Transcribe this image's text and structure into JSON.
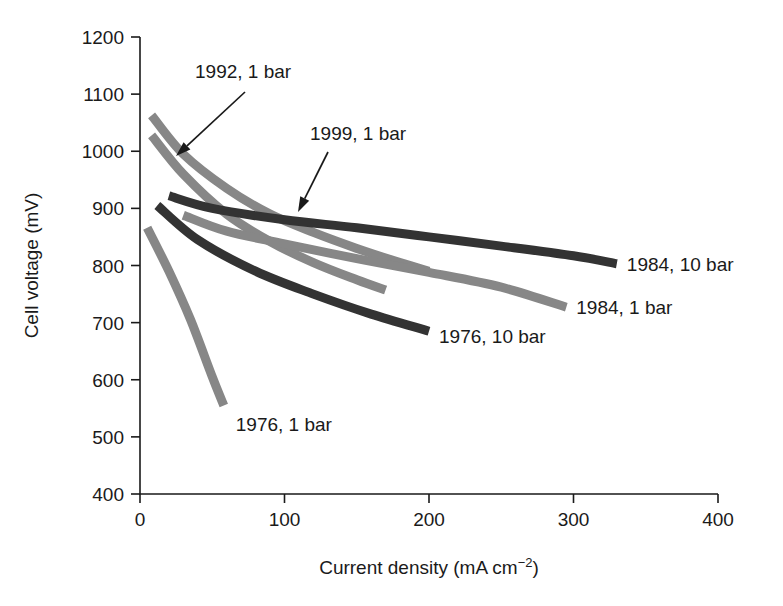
{
  "chart_data": {
    "type": "line",
    "title": "",
    "xlabel": "Current density (mA cm−2)",
    "xlabel_main": "Current density (mA cm",
    "xlabel_sup": "−2",
    "xlabel_tail": ")",
    "ylabel": "Cell voltage (mV)",
    "xlim": [
      0,
      400
    ],
    "ylim": [
      400,
      1200
    ],
    "xticks": [
      "0",
      "100",
      "200",
      "300",
      "400"
    ],
    "xtick_values": [
      0,
      100,
      200,
      300,
      400
    ],
    "yticks": [
      "400",
      "500",
      "600",
      "700",
      "800",
      "900",
      "1000",
      "1100",
      "1200"
    ],
    "ytick_values": [
      400,
      500,
      600,
      700,
      800,
      900,
      1000,
      1100,
      1200
    ],
    "grid": false,
    "legend_position": "inline-annotations",
    "colors": {
      "gray": "#878787",
      "dark": "#333333",
      "axis": "#1a1a1a"
    },
    "series": [
      {
        "name": "1999, 1 bar",
        "label": "1999, 1 bar",
        "color": "#878787",
        "annotation": "arrow",
        "x": [
          8,
          30,
          60,
          90,
          120,
          150,
          180,
          200
        ],
        "y": [
          1063,
          995,
          935,
          890,
          858,
          830,
          805,
          790
        ]
      },
      {
        "name": "1992, 1 bar",
        "label": "1992, 1 bar",
        "color": "#878787",
        "annotation": "arrow",
        "x": [
          8,
          30,
          60,
          90,
          120,
          150,
          170
        ],
        "y": [
          1028,
          960,
          890,
          842,
          805,
          775,
          757
        ]
      },
      {
        "name": "1984, 10 bar",
        "label": "1984, 10 bar",
        "color": "#333333",
        "annotation": "right-label",
        "x": [
          20,
          50,
          100,
          150,
          200,
          250,
          300,
          330
        ],
        "y": [
          922,
          900,
          880,
          866,
          850,
          834,
          817,
          803
        ]
      },
      {
        "name": "1984, 1 bar",
        "label": "1984, 1 bar",
        "color": "#878787",
        "annotation": "right-label",
        "x": [
          30,
          60,
          100,
          150,
          200,
          250,
          295
        ],
        "y": [
          888,
          860,
          838,
          812,
          788,
          762,
          727
        ]
      },
      {
        "name": "1976, 10 bar",
        "label": "1976, 10 bar",
        "color": "#333333",
        "annotation": "right-label",
        "x": [
          12,
          40,
          80,
          120,
          160,
          200
        ],
        "y": [
          905,
          845,
          790,
          750,
          715,
          685
        ]
      },
      {
        "name": "1976, 1 bar",
        "label": "1976, 1 bar",
        "color": "#878787",
        "annotation": "below-label",
        "x": [
          5,
          20,
          35,
          50,
          58
        ],
        "y": [
          866,
          790,
          705,
          605,
          555
        ]
      }
    ],
    "annotations": [
      {
        "text": "1992, 1 bar",
        "text_x": 195,
        "text_y": 78,
        "arrow_from_x": 245,
        "arrow_from_y": 92,
        "arrow_to_x": 176,
        "arrow_to_y": 156
      },
      {
        "text": "1999, 1 bar",
        "text_x": 310,
        "text_y": 140,
        "arrow_from_x": 328,
        "arrow_from_y": 152,
        "arrow_to_x": 298,
        "arrow_to_y": 212
      }
    ]
  }
}
